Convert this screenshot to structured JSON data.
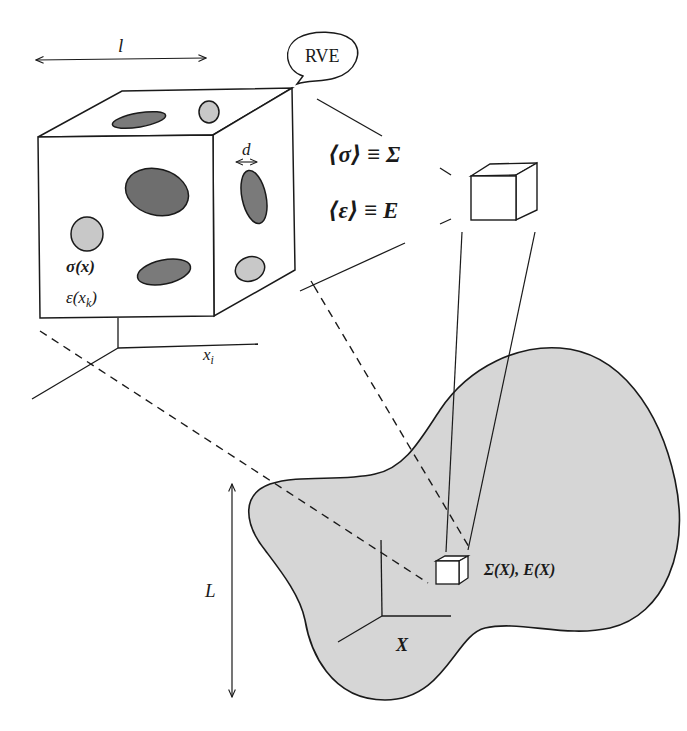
{
  "figure": {
    "colors": {
      "line": "#1a1a1a",
      "background": "#ffffff",
      "body_fill": "#d6d6d6",
      "inclusion_dark": "#7a7a7a",
      "inclusion_light": "#c8c8c8"
    }
  },
  "labels": {
    "rve_length": "l",
    "rve_bubble": "RVE",
    "inclusion_size": "d",
    "micro_stress": "σ(x)",
    "micro_strain_base": "ε(x",
    "micro_strain_sub": "k",
    "micro_strain_close": ")",
    "micro_coord_base": "x",
    "micro_coord_sub": "i",
    "avg_stress": "⟨σ⟩ ≡ Σ",
    "avg_strain": "⟨ε⟩ ≡ E",
    "macro_fields": "Σ(X), E(X)",
    "macro_coord": "X",
    "macro_length": "L"
  },
  "elements": {
    "rve_cube": {
      "name": "RVE microstructure cube",
      "inclusions": 8
    },
    "small_cube": {
      "name": "homogenized material point"
    },
    "macro_body": {
      "name": "macroscopic body"
    },
    "macro_point_cube": {
      "name": "material point in macro body"
    }
  }
}
